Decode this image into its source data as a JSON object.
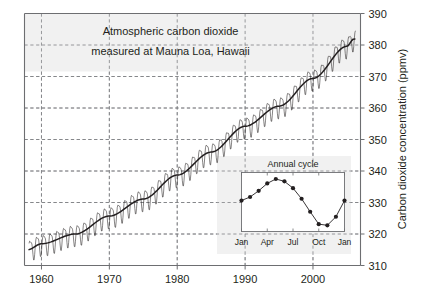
{
  "chart_data": {
    "type": "line",
    "title": "Atmospheric carbon dioxide measured at Mauna Loa, Hawaii",
    "title_line1": "Atmospheric carbon dioxide",
    "title_line2": "measured at Mauna Loa, Hawaii",
    "xlabel": "",
    "ylabel": "Carbon dioxide concentration (ppmv)",
    "xlim": [
      1957.5,
      2007.0
    ],
    "ylim": [
      310,
      390
    ],
    "y_ticks": [
      310,
      320,
      330,
      340,
      350,
      360,
      370,
      380,
      390
    ],
    "y_tick_labels": [
      "310",
      "320",
      "330",
      "340",
      "350",
      "360",
      "370",
      "380",
      "390"
    ],
    "x_ticks": [
      1960,
      1970,
      1980,
      1990,
      2000
    ],
    "x_tick_labels": [
      "1960",
      "1970",
      "1980",
      "1990",
      "2000"
    ],
    "y_axis_position": "right",
    "grid": "dashed-both",
    "legend": "none",
    "series": [
      {
        "name": "Monthly mean CO2 (ppmv)",
        "style": "thin sawtooth line",
        "x": [
          1958.2,
          1958.5,
          1958.8,
          1959.0,
          1959.3,
          1959.5,
          1959.8,
          1960.0,
          1960.3,
          1960.5,
          1960.8,
          1961.0,
          1961.3,
          1961.5,
          1961.8,
          1962.0,
          1962.3,
          1962.5,
          1962.8,
          1963.0,
          1963.3,
          1963.5,
          1963.8,
          1964.0,
          1964.3,
          1964.5,
          1964.8,
          1965.0,
          1965.3,
          1965.5,
          1965.8,
          1966.0,
          1966.3,
          1966.5,
          1966.8,
          1967.0,
          1967.3,
          1967.5,
          1967.8,
          1968.0,
          1968.3,
          1968.5,
          1968.8,
          1969.0,
          1969.3,
          1969.5,
          1969.8,
          1970.0,
          1970.3,
          1970.5,
          1970.8,
          1971.0,
          1971.3,
          1971.5,
          1971.8,
          1972.0,
          1972.3,
          1972.5,
          1972.8,
          1973.0,
          1973.3,
          1973.5,
          1973.8,
          1974.0,
          1974.3,
          1974.5,
          1974.8,
          1975.0,
          1975.3,
          1975.5,
          1975.8,
          1976.0,
          1976.3,
          1976.5,
          1976.8,
          1977.0,
          1977.3,
          1977.5,
          1977.8,
          1978.0,
          1978.3,
          1978.5,
          1978.8,
          1979.0,
          1979.3,
          1979.5,
          1979.8,
          1980.0,
          1980.3,
          1980.5,
          1980.8,
          1981.0,
          1981.3,
          1981.5,
          1981.8,
          1982.0,
          1982.3,
          1982.5,
          1982.8,
          1983.0,
          1983.3,
          1983.5,
          1983.8,
          1984.0,
          1984.3,
          1984.5,
          1984.8,
          1985.0,
          1985.3,
          1985.5,
          1985.8,
          1986.0,
          1986.3,
          1986.5,
          1986.8,
          1987.0,
          1987.3,
          1987.5,
          1987.8,
          1988.0,
          1988.3,
          1988.5,
          1988.8,
          1989.0,
          1989.3,
          1989.5,
          1989.8,
          1990.0,
          1990.3,
          1990.5,
          1990.8,
          1991.0,
          1991.3,
          1991.5,
          1991.8,
          1992.0,
          1992.3,
          1992.5,
          1992.8,
          1993.0,
          1993.3,
          1993.5,
          1993.8,
          1994.0,
          1994.3,
          1994.5,
          1994.8,
          1995.0,
          1995.3,
          1995.5,
          1995.8,
          1996.0,
          1996.3,
          1996.5,
          1996.8,
          1997.0,
          1997.3,
          1997.5,
          1997.8,
          1998.0,
          1998.3,
          1998.5,
          1998.8,
          1999.0,
          1999.3,
          1999.5,
          1999.8,
          2000.0,
          2000.3,
          2000.5,
          2000.8,
          2001.0,
          2001.3,
          2001.5,
          2001.8,
          2002.0,
          2002.3,
          2002.5,
          2002.8,
          2003.0,
          2003.3,
          2003.5,
          2003.8,
          2004.0,
          2004.3,
          2004.5,
          2004.8,
          2005.0,
          2005.3,
          2005.5,
          2005.8,
          2006.0,
          2006.2
        ],
        "description": "Monthly mean CO2 concentration showing annual sawtooth oscillation superimposed on rising trend, from about 315 ppmv in 1958 to about 382 ppmv in 2006"
      },
      {
        "name": "Smoothed trend",
        "style": "thick smooth line",
        "anchor_years": [
          1958,
          1960,
          1965,
          1970,
          1975,
          1980,
          1985,
          1990,
          1995,
          2000,
          2005,
          2006
        ],
        "anchor_values": [
          315.0,
          316.9,
          320.0,
          325.7,
          331.1,
          338.7,
          346.0,
          354.2,
          360.6,
          369.4,
          379.6,
          381.9
        ]
      }
    ],
    "annual_amplitude_ppmv": 6.5,
    "inset": {
      "type": "line",
      "title": "Annual cycle",
      "x_tick_labels": [
        "Jan",
        "Apr",
        "Jul",
        "Oct",
        "Jan"
      ],
      "x_ticks": [
        1,
        4,
        7,
        10,
        13
      ],
      "months": [
        "Jan",
        "Feb",
        "Mar",
        "Apr",
        "May",
        "Jun",
        "Jul",
        "Aug",
        "Sep",
        "Oct",
        "Nov",
        "Dec",
        "Jan"
      ],
      "values": [
        328.0,
        329.2,
        331.3,
        333.8,
        335.3,
        334.5,
        332.2,
        328.6,
        324.2,
        320.0,
        319.6,
        322.5,
        328.0
      ],
      "ylim": [
        317.5,
        337.5
      ],
      "markers": "filled circles",
      "grid": "none"
    }
  },
  "axis": {
    "y_label": "Carbon dioxide concentration (ppmv)"
  },
  "titles": {
    "main_line1": "Atmospheric carbon dioxide",
    "main_line2": "measured at Mauna Loa, Hawaii",
    "inset": "Annual cycle"
  },
  "colors": {
    "background": "#ffffff",
    "frame": "#6d6e71",
    "grid": "#808285",
    "data": "#231f20",
    "panel_fill": "#f1f1f1",
    "text": "#231f20"
  }
}
